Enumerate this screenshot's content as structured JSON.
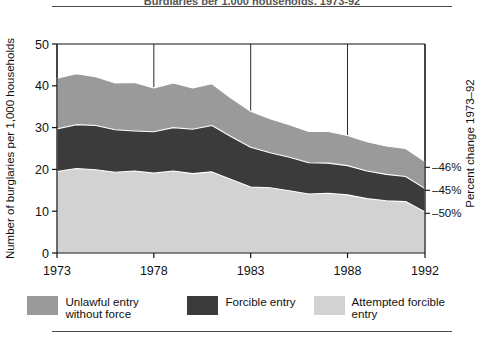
{
  "figure": {
    "title": "Burglaries per 1,000 households, 1973-92"
  },
  "axes": {
    "y_left_title": "Number of burglaries per 1,000 households",
    "y_right_title": "Percent change 1973–92",
    "y_ticks": [
      "0",
      "10",
      "20",
      "30",
      "40",
      "50"
    ],
    "x_ticks": [
      "1973",
      "1978",
      "1983",
      "1988",
      "1992"
    ],
    "pct_labels": [
      {
        "text": "–46%",
        "value": 20.5
      },
      {
        "text": "–45%",
        "value": 15.0
      },
      {
        "text": "–50%",
        "value": 9.5
      }
    ]
  },
  "legend": {
    "items": [
      {
        "label": "Unlawful entry without force",
        "color": "#9a9a9a",
        "key": "unlawful-entry-without-force"
      },
      {
        "label": "Forcible entry",
        "color": "#3b3b3b",
        "key": "forcible-entry"
      },
      {
        "label": "Attempted forcible entry",
        "color": "#d2d2d2",
        "key": "attempted-forcible-entry"
      }
    ]
  },
  "chart_data": {
    "type": "area",
    "stacked": true,
    "title": "Burglaries per 1,000 households, 1973-92",
    "xlabel": "",
    "ylabel": "Number of burglaries per 1,000 households",
    "ylabel_right": "Percent change 1973–92",
    "xlim": [
      1973,
      1992
    ],
    "ylim": [
      0,
      50
    ],
    "grid": true,
    "legend_position": "bottom",
    "x": [
      1973,
      1974,
      1975,
      1976,
      1977,
      1978,
      1979,
      1980,
      1981,
      1982,
      1983,
      1984,
      1985,
      1986,
      1987,
      1988,
      1989,
      1990,
      1991,
      1992
    ],
    "series": [
      {
        "name": "Attempted forcible entry",
        "color": "#d2d2d2",
        "stack_order": 1,
        "values": [
          19.5,
          20.2,
          19.9,
          19.3,
          19.6,
          19.1,
          19.6,
          19.0,
          19.4,
          17.6,
          15.8,
          15.6,
          14.9,
          14.1,
          14.3,
          13.9,
          13.0,
          12.5,
          12.3,
          9.8
        ],
        "percent_change_1973_92": "–50%"
      },
      {
        "name": "Forcible entry",
        "color": "#3b3b3b",
        "stack_order": 2,
        "values": [
          10.2,
          10.5,
          10.6,
          10.2,
          9.6,
          9.9,
          10.4,
          10.6,
          11.1,
          10.2,
          9.5,
          8.4,
          8.0,
          7.5,
          7.2,
          7.0,
          6.6,
          6.3,
          6.0,
          5.6
        ],
        "percent_change_1973_92": "–45%"
      },
      {
        "name": "Unlawful entry without force",
        "color": "#9a9a9a",
        "stack_order": 3,
        "values": [
          12.1,
          12.2,
          11.7,
          11.2,
          11.6,
          10.5,
          10.7,
          9.9,
          10.0,
          9.2,
          8.6,
          8.1,
          7.8,
          7.5,
          7.6,
          7.2,
          7.0,
          6.8,
          6.7,
          6.5
        ],
        "percent_change_1973_92": "–46%"
      }
    ],
    "totals": [
      41.8,
      42.9,
      42.2,
      40.7,
      40.8,
      39.5,
      40.7,
      39.5,
      40.5,
      37.0,
      33.9,
      32.1,
      30.7,
      29.1,
      29.1,
      28.1,
      26.6,
      25.6,
      25.0,
      21.9
    ]
  }
}
